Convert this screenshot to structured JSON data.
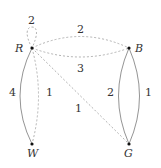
{
  "graph": {
    "nodes": [
      {
        "id": "R",
        "label": "R"
      },
      {
        "id": "B",
        "label": "B"
      },
      {
        "id": "W",
        "label": "W"
      },
      {
        "id": "G",
        "label": "G"
      }
    ],
    "edges": [
      {
        "from": "R",
        "to": "R",
        "weight": "2",
        "style": "dashed",
        "type": "loop"
      },
      {
        "from": "R",
        "to": "B",
        "weight": "2",
        "style": "dashed",
        "curve": "upper"
      },
      {
        "from": "R",
        "to": "B",
        "weight": "3",
        "style": "dashed",
        "curve": "lower"
      },
      {
        "from": "R",
        "to": "W",
        "weight": "4",
        "style": "solid",
        "curve": "left"
      },
      {
        "from": "R",
        "to": "W",
        "weight": "1",
        "style": "dashed",
        "curve": "right"
      },
      {
        "from": "R",
        "to": "G",
        "weight": "1",
        "style": "dashed"
      },
      {
        "from": "B",
        "to": "G",
        "weight": "2",
        "style": "solid",
        "curve": "left"
      },
      {
        "from": "B",
        "to": "G",
        "weight": "1",
        "style": "solid",
        "curve": "right"
      }
    ]
  },
  "colors": {
    "solid_edge": "#888888",
    "dashed_edge": "#aaaaaa",
    "node": "#111111"
  }
}
